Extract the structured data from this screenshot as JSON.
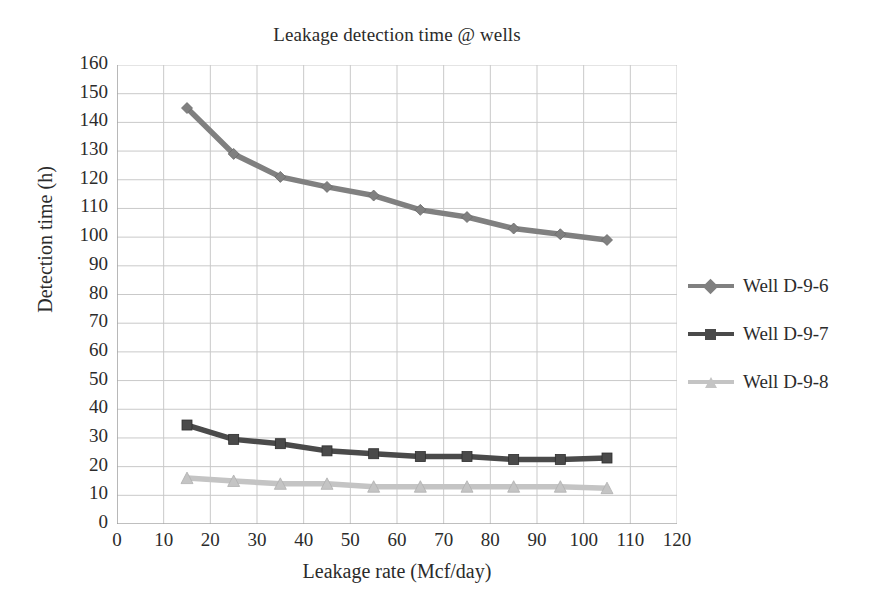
{
  "chart_data": {
    "type": "line",
    "title": "Leakage detection time @ wells",
    "xlabel": "Leakage rate (Mcf/day)",
    "ylabel": "Detection time (h)",
    "xlim": [
      0,
      120
    ],
    "ylim": [
      0,
      160
    ],
    "xticks": [
      0,
      10,
      20,
      30,
      40,
      50,
      60,
      70,
      80,
      90,
      100,
      110,
      120
    ],
    "yticks": [
      0,
      10,
      20,
      30,
      40,
      50,
      60,
      70,
      80,
      90,
      100,
      110,
      120,
      130,
      140,
      150,
      160
    ],
    "grid": true,
    "legend_position": "right",
    "x": [
      15,
      25,
      35,
      45,
      55,
      65,
      75,
      85,
      95,
      105
    ],
    "series": [
      {
        "name": "Well D-9-6",
        "marker": "diamond",
        "color": "#808080",
        "values": [
          145,
          129,
          121,
          117.5,
          114.5,
          109.5,
          107,
          103,
          101,
          99
        ]
      },
      {
        "name": "Well D-9-7",
        "marker": "square",
        "color": "#4a4a4a",
        "values": [
          34.5,
          29.5,
          28,
          25.5,
          24.5,
          23.5,
          23.5,
          22.5,
          22.5,
          23
        ]
      },
      {
        "name": "Well D-9-8",
        "marker": "triangle",
        "color": "#c4c4c4",
        "values": [
          16,
          15,
          14,
          14,
          13,
          13,
          13,
          13,
          13,
          12.5
        ]
      }
    ]
  },
  "style": {
    "grid_color": "#c9c9c9",
    "axis_color": "#9a9a9a",
    "text_color": "#2b2b2b",
    "background": "#ffffff"
  }
}
